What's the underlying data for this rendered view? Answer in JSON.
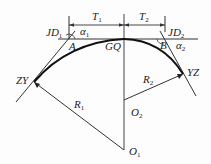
{
  "diagram": {
    "type": "reverse curve with common tangent point",
    "colors": {
      "line": "#333333",
      "curve": "#111111",
      "background": "#fdfdfd"
    },
    "labels": {
      "T1": {
        "main": "T",
        "sub": "1"
      },
      "T2": {
        "main": "T",
        "sub": "2"
      },
      "JD1": {
        "main": "JD",
        "sub": "1"
      },
      "JD2": {
        "main": "JD",
        "sub": "2"
      },
      "alpha1": {
        "main": "α",
        "sub": "1"
      },
      "alpha2": {
        "main": "α",
        "sub": "2"
      },
      "A": {
        "main": "A"
      },
      "B": {
        "main": "B"
      },
      "GQ": {
        "main": "GQ"
      },
      "ZY": {
        "main": "ZY"
      },
      "YZ": {
        "main": "YZ"
      },
      "R1": {
        "main": "R",
        "sub": "1"
      },
      "R2": {
        "main": "R",
        "sub": "2"
      },
      "O1": {
        "main": "O",
        "sub": "1"
      },
      "O2": {
        "main": "O",
        "sub": "2"
      }
    },
    "points": {
      "ZY": [
        34,
        82
      ],
      "GQ": [
        124,
        39
      ],
      "YZ": [
        183,
        74
      ],
      "JD1": [
        69,
        39
      ],
      "JD2": [
        165,
        39
      ],
      "O1": [
        124,
        150
      ],
      "O2": [
        124,
        100
      ]
    }
  }
}
